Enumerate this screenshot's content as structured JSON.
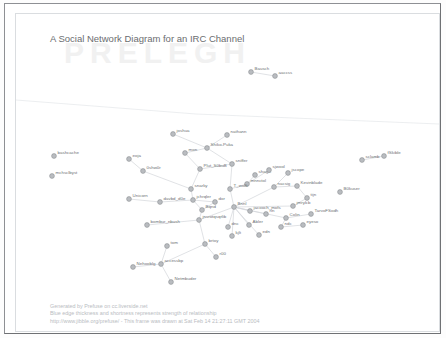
{
  "window": {
    "title": "A Social Network Diagram for an IRC Channel",
    "watermark": "PRELEGH"
  },
  "footer": {
    "lines": [
      "Generated by Prefuse on cc.liverside.net",
      "Blue edge thickness and shortness represents strength of relationship",
      "http://www.jibble.org/prefuse/ - This frame was drawn at Sat Feb 14 21:27:11 GMT 2004"
    ]
  },
  "colors": {
    "node_fill": "#b9bcc0",
    "node_stroke": "#8d9094",
    "edge": "#d2d6da",
    "label": "#6e7174",
    "title": "#6b6d70",
    "footer": "#b9bcbf",
    "frame": "#8e9094"
  },
  "graph_data": {
    "type": "node-link-diagram",
    "title": "A Social Network Diagram for an IRC Channel",
    "node_count": 58,
    "edge_count": 62,
    "nodes": [
      {
        "id": "bashcache",
        "label": "bashcache",
        "x": 38,
        "y": 142
      },
      {
        "id": "mchsclbyst",
        "label": "mchsclbyst",
        "x": 36,
        "y": 162
      },
      {
        "id": "Bausch",
        "label": "Bausch",
        "x": 235,
        "y": 58
      },
      {
        "id": "aaccss",
        "label": "aaccss",
        "x": 259,
        "y": 62
      },
      {
        "id": "joshua",
        "label": "joshua",
        "x": 157,
        "y": 120
      },
      {
        "id": "nathann",
        "label": "nathann",
        "x": 211,
        "y": 121
      },
      {
        "id": "Shiko-Puka",
        "label": "Shiko-Puka",
        "x": 191,
        "y": 134
      },
      {
        "id": "mon",
        "label": "mon",
        "x": 169,
        "y": 139
      },
      {
        "id": "sclamb",
        "label": "sclamb",
        "x": 346,
        "y": 146
      },
      {
        "id": "fSkible",
        "label": "fSkible",
        "x": 368,
        "y": 142
      },
      {
        "id": "eoja",
        "label": "eoja",
        "x": 113,
        "y": 145
      },
      {
        "id": "sniffer",
        "label": "sniffer",
        "x": 216,
        "y": 150
      },
      {
        "id": "0shw0r",
        "label": "0shw0r",
        "x": 127,
        "y": 157
      },
      {
        "id": "Plut_S0buB",
        "label": "Plut_S0buB",
        "x": 184,
        "y": 155
      },
      {
        "id": "shagic",
        "label": "shagic",
        "x": 239,
        "y": 161
      },
      {
        "id": "sjwool",
        "label": "sjwool",
        "x": 253,
        "y": 156
      },
      {
        "id": "jscope",
        "label": "jscope",
        "x": 272,
        "y": 159
      },
      {
        "id": "mnnctol",
        "label": "mnnctol",
        "x": 231,
        "y": 170
      },
      {
        "id": "nacsig",
        "label": "nacsig",
        "x": 258,
        "y": 173
      },
      {
        "id": "Kevinblade",
        "label": "Kevinblade",
        "x": 281,
        "y": 172
      },
      {
        "id": "B0kuser",
        "label": "B0kuser",
        "x": 324,
        "y": 178
      },
      {
        "id": "Unicorn",
        "label": "Unicorn",
        "x": 113,
        "y": 185
      },
      {
        "id": "snarky",
        "label": "snarky",
        "x": 175,
        "y": 175
      },
      {
        "id": "T_wolfi",
        "label": "T_wolfi",
        "x": 214,
        "y": 175
      },
      {
        "id": "tijn",
        "label": "tijn",
        "x": 291,
        "y": 184
      },
      {
        "id": "davbd_d0e",
        "label": "davbd_d0e",
        "x": 144,
        "y": 188
      },
      {
        "id": "jchrqler",
        "label": "jchrqler",
        "x": 177,
        "y": 186
      },
      {
        "id": "dor",
        "label": "dor",
        "x": 199,
        "y": 188
      },
      {
        "id": "Bqnd",
        "label": "Bqnd",
        "x": 186,
        "y": 196
      },
      {
        "id": "Bnnl",
        "label": "Bnnl",
        "x": 218,
        "y": 193
      },
      {
        "id": "jmrylcb",
        "label": "jmrylcb",
        "x": 277,
        "y": 192
      },
      {
        "id": "jacooch_mofs",
        "label": "jacooch_mofs",
        "x": 234,
        "y": 197
      },
      {
        "id": "rln",
        "label": "rln",
        "x": 250,
        "y": 200
      },
      {
        "id": "Colin",
        "label": "Colin",
        "x": 270,
        "y": 204
      },
      {
        "id": "TarvoFSodh",
        "label": "TarvoFSodh",
        "x": 295,
        "y": 200
      },
      {
        "id": "ndc",
        "label": "ndc",
        "x": 265,
        "y": 213
      },
      {
        "id": "eyeso",
        "label": "eyeso",
        "x": 287,
        "y": 211
      },
      {
        "id": "jnsrotqsqrlib",
        "label": "jnsrotqsqrlib",
        "x": 183,
        "y": 206
      },
      {
        "id": "bombur_nbush",
        "label": "bombur_nbush",
        "x": 131,
        "y": 211
      },
      {
        "id": "dnc",
        "label": "dnc",
        "x": 212,
        "y": 213
      },
      {
        "id": "Abler",
        "label": "Abler",
        "x": 233,
        "y": 211
      },
      {
        "id": "kjlt",
        "label": "kjlt",
        "x": 216,
        "y": 222
      },
      {
        "id": "edn",
        "label": "edn",
        "x": 243,
        "y": 221
      },
      {
        "id": "tom",
        "label": "tom",
        "x": 151,
        "y": 232
      },
      {
        "id": "brtoy",
        "label": "brtoy",
        "x": 189,
        "y": 230
      },
      {
        "id": "r00",
        "label": "r00",
        "x": 200,
        "y": 243
      },
      {
        "id": "Nehooblg",
        "label": "Nehooblg",
        "x": 117,
        "y": 253
      },
      {
        "id": "accessbp",
        "label": "accessbp",
        "x": 145,
        "y": 250
      },
      {
        "id": "Netmbuder",
        "label": "Netmbuder",
        "x": 155,
        "y": 268
      }
    ],
    "edges": [
      {
        "from": "Bausch",
        "to": "aaccss"
      },
      {
        "from": "sclamb",
        "to": "fSkible"
      },
      {
        "from": "joshua",
        "to": "Shiko-Puka"
      },
      {
        "from": "nathann",
        "to": "Shiko-Puka"
      },
      {
        "from": "Shiko-Puka",
        "to": "mon"
      },
      {
        "from": "Shiko-Puka",
        "to": "sniffer"
      },
      {
        "from": "mon",
        "to": "Plut_S0buB"
      },
      {
        "from": "eoja",
        "to": "0shw0r"
      },
      {
        "from": "0shw0r",
        "to": "snarky"
      },
      {
        "from": "Plut_S0buB",
        "to": "snarky"
      },
      {
        "from": "Plut_S0buB",
        "to": "sniffer"
      },
      {
        "from": "sniffer",
        "to": "T_wolfi"
      },
      {
        "from": "shagic",
        "to": "mnnctol"
      },
      {
        "from": "sjwool",
        "to": "mnnctol"
      },
      {
        "from": "jscope",
        "to": "nacsig"
      },
      {
        "from": "mnnctol",
        "to": "T_wolfi"
      },
      {
        "from": "nacsig",
        "to": "Bnnl"
      },
      {
        "from": "Kevinblade",
        "to": "nacsig"
      },
      {
        "from": "Kevinblade",
        "to": "tijn"
      },
      {
        "from": "tijn",
        "to": "jmrylcb"
      },
      {
        "from": "jmrylcb",
        "to": "Bnnl"
      },
      {
        "from": "Unicorn",
        "to": "davbd_d0e"
      },
      {
        "from": "davbd_d0e",
        "to": "jchrqler"
      },
      {
        "from": "snarky",
        "to": "jchrqler"
      },
      {
        "from": "jchrqler",
        "to": "dor"
      },
      {
        "from": "jchrqler",
        "to": "Bqnd"
      },
      {
        "from": "dor",
        "to": "Bqnd"
      },
      {
        "from": "Bqnd",
        "to": "jnsrotqsqrlib"
      },
      {
        "from": "T_wolfi",
        "to": "Bnnl"
      },
      {
        "from": "jacooch_mofs",
        "to": "Bnnl"
      },
      {
        "from": "Bnnl",
        "to": "rln"
      },
      {
        "from": "Bnnl",
        "to": "Colin"
      },
      {
        "from": "Bnnl",
        "to": "dnc"
      },
      {
        "from": "Bnnl",
        "to": "Abler"
      },
      {
        "from": "Bnnl",
        "to": "kjlt"
      },
      {
        "from": "Bnnl",
        "to": "edn"
      },
      {
        "from": "Bnnl",
        "to": "jnsrotqsqrlib"
      },
      {
        "from": "Colin",
        "to": "ndc"
      },
      {
        "from": "Colin",
        "to": "TarvoFSodh"
      },
      {
        "from": "ndc",
        "to": "eyeso"
      },
      {
        "from": "jnsrotqsqrlib",
        "to": "bombur_nbush"
      },
      {
        "from": "jnsrotqsqrlib",
        "to": "brtoy"
      },
      {
        "from": "tom",
        "to": "accessbp"
      },
      {
        "from": "brtoy",
        "to": "r00"
      },
      {
        "from": "accessbp",
        "to": "Nehooblg"
      },
      {
        "from": "accessbp",
        "to": "Netmbuder"
      },
      {
        "from": "accessbp",
        "to": "brtoy"
      }
    ]
  }
}
